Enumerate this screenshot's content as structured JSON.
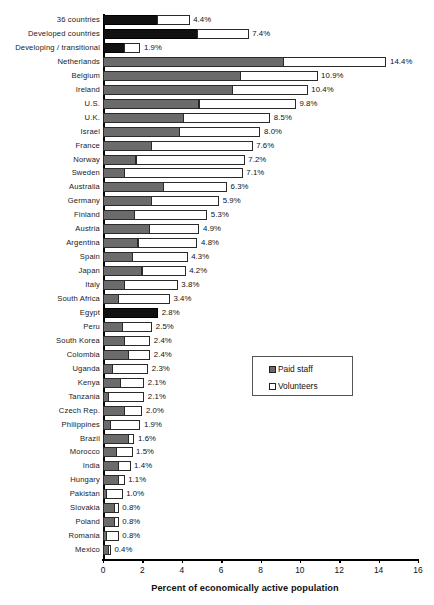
{
  "chart_data": {
    "type": "bar",
    "orientation": "horizontal",
    "stacked": true,
    "title": "",
    "xlabel": "Percent of economically active population",
    "ylabel": "",
    "xlim": [
      0,
      16
    ],
    "xticks": [
      0,
      2,
      4,
      6,
      8,
      10,
      12,
      14,
      16
    ],
    "grid": false,
    "legend_position": "middle-right",
    "series": [
      {
        "name": "Paid staff",
        "color": "#6b6b6b"
      },
      {
        "name": "Volunteers",
        "color": "#ffffff"
      }
    ],
    "categories": [
      "36 countries",
      "Developed countries",
      "Developing / transitional",
      "Netherlands",
      "Belgium",
      "Ireland",
      "U.S.",
      "U.K.",
      "Israel",
      "France",
      "Norway",
      "Sweden",
      "Australia",
      "Germany",
      "Finland",
      "Austria",
      "Argentina",
      "Spain",
      "Japan",
      "Italy",
      "South Africa",
      "Egypt",
      "Peru",
      "South Korea",
      "Colombia",
      "Uganda",
      "Kenya",
      "Tanzania",
      "Czech Rep.",
      "Philippines",
      "Brazil",
      "Morocco",
      "India",
      "Hungary",
      "Pakistan",
      "Slovakia",
      "Poland",
      "Romania",
      "Mexico"
    ],
    "totals": [
      4.4,
      7.4,
      1.9,
      14.4,
      10.9,
      10.4,
      9.8,
      8.5,
      8.0,
      7.6,
      7.2,
      7.1,
      6.3,
      5.9,
      5.3,
      4.9,
      4.8,
      4.3,
      4.2,
      3.8,
      3.4,
      2.8,
      2.5,
      2.4,
      2.4,
      2.3,
      2.1,
      2.1,
      2.0,
      1.9,
      1.6,
      1.5,
      1.4,
      1.1,
      1.0,
      0.8,
      0.8,
      0.8,
      0.4
    ],
    "paid_values": [
      2.8,
      4.8,
      1.1,
      9.2,
      7.0,
      6.6,
      4.9,
      4.1,
      3.9,
      2.5,
      1.7,
      1.1,
      3.1,
      2.5,
      1.6,
      2.4,
      1.8,
      1.5,
      2.0,
      1.1,
      0.8,
      2.8,
      1.0,
      1.1,
      1.3,
      0.5,
      0.9,
      0.3,
      1.1,
      0.4,
      1.3,
      0.7,
      0.8,
      0.8,
      0.2,
      0.6,
      0.6,
      0.2,
      0.3
    ],
    "volunteer_values": [
      1.6,
      2.6,
      0.8,
      5.2,
      3.9,
      3.8,
      4.9,
      4.4,
      4.1,
      5.1,
      5.5,
      6.0,
      3.2,
      3.4,
      3.7,
      2.5,
      3.0,
      2.8,
      2.2,
      2.7,
      2.6,
      0.0,
      1.5,
      1.3,
      1.1,
      1.8,
      1.2,
      1.8,
      0.9,
      1.5,
      0.3,
      0.8,
      0.6,
      0.3,
      0.8,
      0.2,
      0.2,
      0.6,
      0.1
    ],
    "value_labels": [
      "4.4%",
      "7.4%",
      "1.9%",
      "14.4%",
      "10.9%",
      "10.4%",
      "9.8%",
      "8.5%",
      "8.0%",
      "7.6%",
      "7.2%",
      "7.1%",
      "6.3%",
      "5.9%",
      "5.3%",
      "4.9%",
      "4.8%",
      "4.3%",
      "4.2%",
      "3.8%",
      "3.4%",
      "2.8%",
      "2.5%",
      "2.4%",
      "2.4%",
      "2.3%",
      "2.1%",
      "2.1%",
      "2.0%",
      "1.9%",
      "1.6%",
      "1.5%",
      "1.4%",
      "1.1%",
      "1.0%",
      "0.8%",
      "0.8%",
      "0.8%",
      "0.4%"
    ],
    "highlighted_rows": [
      0,
      1,
      2,
      21
    ],
    "highlight_color": "#111111"
  },
  "legend": {
    "items": [
      {
        "label": "Paid staff",
        "swatch": "paid"
      },
      {
        "label": "Volunteers",
        "swatch": "vol"
      }
    ]
  },
  "axis": {
    "x_title": "Percent of economically active population",
    "tick_labels": [
      "0",
      "2",
      "4",
      "6",
      "8",
      "10",
      "12",
      "14",
      "16"
    ]
  }
}
